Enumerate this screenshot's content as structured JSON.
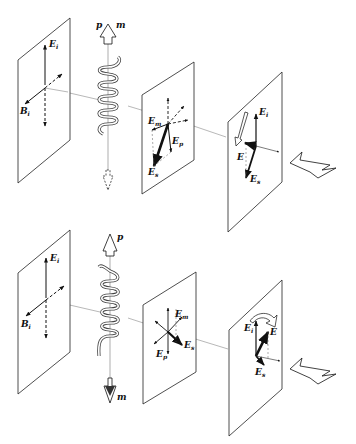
{
  "diagram": {
    "type": "physics-schematic",
    "panels": [
      {
        "id": "top",
        "helix_dipoles": {
          "electric_label": "p",
          "magnetic_label": "m",
          "relation": "p and m parallel (both up)"
        },
        "incident_plane": {
          "labels": {
            "E": "E",
            "E_sub": "i",
            "B": "B",
            "B_sub": "i"
          }
        },
        "scattered_plane": {
          "labels": [
            {
              "main": "E",
              "sub": "m"
            },
            {
              "main": "E",
              "sub": "p"
            },
            {
              "main": "E",
              "sub": "s"
            }
          ]
        },
        "resultant_plane": {
          "labels": [
            {
              "main": "E",
              "sub": "i"
            },
            {
              "main": "E",
              "sub": ""
            },
            {
              "main": "E",
              "sub": "s"
            }
          ],
          "rotation_arrow": "clockwise-down"
        }
      },
      {
        "id": "bottom",
        "helix_dipoles": {
          "electric_label": "p",
          "magnetic_label": "m",
          "relation": "p up, m down (antiparallel)"
        },
        "incident_plane": {
          "labels": {
            "E": "E",
            "E_sub": "i",
            "B": "B",
            "B_sub": "i"
          }
        },
        "scattered_plane": {
          "labels": [
            {
              "main": "E",
              "sub": "m"
            },
            {
              "main": "E",
              "sub": "p"
            },
            {
              "main": "E",
              "sub": "s"
            }
          ]
        },
        "resultant_plane": {
          "labels": [
            {
              "main": "E",
              "sub": "i"
            },
            {
              "main": "E",
              "sub": ""
            },
            {
              "main": "E",
              "sub": "s"
            }
          ],
          "rotation_arrow": "counterclockwise-over-top"
        }
      }
    ],
    "propagation_arrow": "hollow arrow pointing right-down (direction of propagation)"
  },
  "labels": {
    "top": {
      "Ei": "E",
      "Ei_sub": "i",
      "Bi": "B",
      "Bi_sub": "i",
      "p": "p",
      "m": "m",
      "Em": "E",
      "Em_sub": "m",
      "Ep": "E",
      "Ep_sub": "p",
      "Es": "E",
      "Es_sub": "s",
      "R_Ei": "E",
      "R_Ei_sub": "i",
      "R_E": "E",
      "R_Es": "E",
      "R_Es_sub": "s"
    },
    "bottom": {
      "Ei": "E",
      "Ei_sub": "i",
      "Bi": "B",
      "Bi_sub": "i",
      "p": "p",
      "m": "m",
      "Em": "E",
      "Em_sub": "m",
      "Ep": "E",
      "Ep_sub": "p",
      "Es": "E",
      "Es_sub": "s",
      "R_Ei": "E",
      "R_Ei_sub": "i",
      "R_E": "E",
      "R_Es": "E",
      "R_Es_sub": "s"
    }
  }
}
